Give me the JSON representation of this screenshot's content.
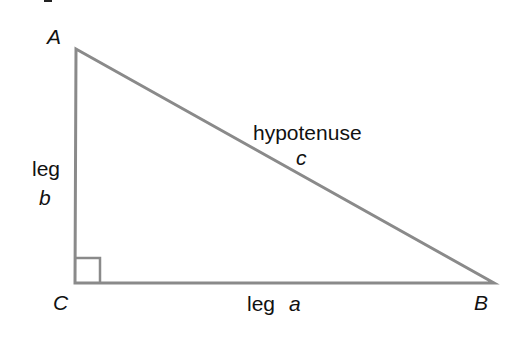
{
  "diagram": {
    "vertices": {
      "A": {
        "label": "A",
        "x": 76,
        "y": 49
      },
      "B": {
        "label": "B",
        "x": 494,
        "y": 283
      },
      "C": {
        "label": "C",
        "x": 75,
        "y": 283
      }
    },
    "sides": {
      "hypotenuse": {
        "name": "hypotenuse",
        "symbol": "c"
      },
      "leg_a": {
        "name": "leg",
        "symbol": "a"
      },
      "leg_b": {
        "name": "leg",
        "symbol": "b"
      }
    },
    "right_angle_at": "C",
    "colors": {
      "line": "#8a8a8a",
      "text": "#111111",
      "background": "#ffffff"
    }
  }
}
